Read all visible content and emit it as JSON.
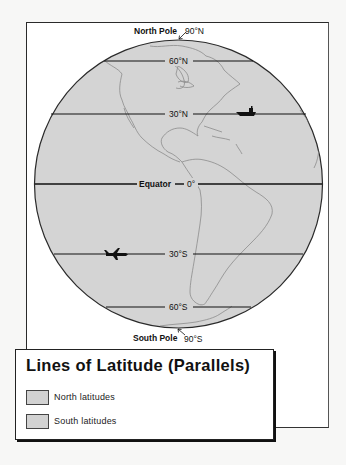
{
  "map": {
    "north_pole_label": "North Pole",
    "north_pole_degree": "90°N",
    "south_pole_label": "South Pole",
    "south_pole_degree": "90°S",
    "equator_label": "Equator",
    "parallels": [
      {
        "name": "60N",
        "label": "60°N"
      },
      {
        "name": "30N",
        "label": "30°N"
      },
      {
        "name": "0",
        "label": "0°"
      },
      {
        "name": "30S",
        "label": "30°S"
      },
      {
        "name": "60S",
        "label": "60°S"
      }
    ],
    "icons": [
      "ship-icon",
      "airplane-icon"
    ],
    "colors": {
      "globe_fill": "#d4d4d4",
      "coastline": "#8a8a8a",
      "parallel_line": "#111111"
    }
  },
  "legend": {
    "title": "Lines of Latitude (Parallels)",
    "items": [
      {
        "label": "North latitudes",
        "color": "#d2d2d2"
      },
      {
        "label": "South latitudes",
        "color": "#d2d2d2"
      }
    ]
  }
}
